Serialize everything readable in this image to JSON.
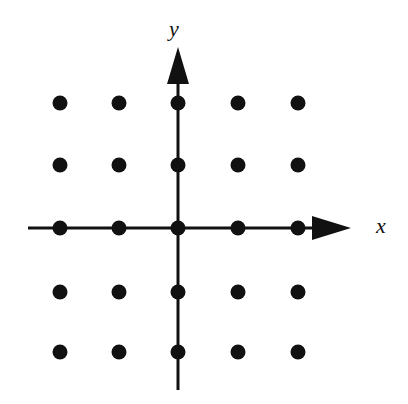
{
  "figure": {
    "background_color": "#ffffff",
    "ink_color": "#111111",
    "width": 408,
    "height": 404
  },
  "axes": {
    "origin": {
      "x": 178,
      "y": 228
    },
    "x_axis": {
      "name": "x-axis",
      "label": "x",
      "label_position": {
        "x": 381,
        "y": 228
      },
      "label_font_size": 22,
      "line": {
        "x1": 28,
        "y1": 228,
        "x2": 316,
        "y2": 228
      },
      "stroke_width": 3,
      "arrow": {
        "base_x": 312,
        "tip_x": 351,
        "half_height": 12,
        "direction": "right"
      }
    },
    "y_axis": {
      "name": "y-axis",
      "label": "y",
      "label_position": {
        "x": 174,
        "y": 31
      },
      "label_font_size": 22,
      "line": {
        "x1": 178,
        "y1": 390,
        "x2": 178,
        "y2": 80
      },
      "stroke_width": 3,
      "arrow": {
        "base_y": 84,
        "tip_y": 47,
        "half_width": 11,
        "direction": "up"
      }
    }
  },
  "chart_data": {
    "type": "scatter",
    "xlabel": "x",
    "ylabel": "y",
    "grid": false,
    "legend": false,
    "xlim": [
      -2,
      2
    ],
    "ylim": [
      -2,
      2
    ],
    "xticklabels": [],
    "yticklabels": [],
    "marker": {
      "shape": "circle",
      "color": "#111111",
      "diameter_px": 15
    },
    "point_count": 25,
    "columns_px": [
      60,
      119,
      178,
      238,
      298
    ],
    "rows_px": [
      103,
      165,
      228,
      292,
      352
    ],
    "x": [
      -2,
      -1,
      0,
      1,
      2,
      -2,
      -1,
      0,
      1,
      2,
      -2,
      -1,
      0,
      1,
      2,
      -2,
      -1,
      0,
      1,
      2,
      -2,
      -1,
      0,
      1,
      2
    ],
    "y": [
      2,
      2,
      2,
      2,
      2,
      1,
      1,
      1,
      1,
      1,
      0,
      0,
      0,
      0,
      0,
      -1,
      -1,
      -1,
      -1,
      -1,
      -2,
      -2,
      -2,
      -2,
      -2
    ],
    "points": [
      {
        "x": -2,
        "y": 2,
        "px": 60,
        "py": 103
      },
      {
        "x": -1,
        "y": 2,
        "px": 119,
        "py": 103
      },
      {
        "x": 0,
        "y": 2,
        "px": 178,
        "py": 103
      },
      {
        "x": 1,
        "y": 2,
        "px": 238,
        "py": 103
      },
      {
        "x": 2,
        "y": 2,
        "px": 298,
        "py": 103
      },
      {
        "x": -2,
        "y": 1,
        "px": 60,
        "py": 165
      },
      {
        "x": -1,
        "y": 1,
        "px": 119,
        "py": 165
      },
      {
        "x": 0,
        "y": 1,
        "px": 178,
        "py": 165
      },
      {
        "x": 1,
        "y": 1,
        "px": 238,
        "py": 165
      },
      {
        "x": 2,
        "y": 1,
        "px": 298,
        "py": 165
      },
      {
        "x": -2,
        "y": 0,
        "px": 60,
        "py": 228
      },
      {
        "x": -1,
        "y": 0,
        "px": 119,
        "py": 228
      },
      {
        "x": 0,
        "y": 0,
        "px": 178,
        "py": 228
      },
      {
        "x": 1,
        "y": 0,
        "px": 238,
        "py": 228
      },
      {
        "x": 2,
        "y": 0,
        "px": 298,
        "py": 228
      },
      {
        "x": -2,
        "y": -1,
        "px": 60,
        "py": 292
      },
      {
        "x": -1,
        "y": -1,
        "px": 119,
        "py": 292
      },
      {
        "x": 0,
        "y": -1,
        "px": 178,
        "py": 292
      },
      {
        "x": 1,
        "y": -1,
        "px": 238,
        "py": 292
      },
      {
        "x": 2,
        "y": -1,
        "px": 298,
        "py": 292
      },
      {
        "x": -2,
        "y": -2,
        "px": 60,
        "py": 352
      },
      {
        "x": -1,
        "y": -2,
        "px": 119,
        "py": 352
      },
      {
        "x": 0,
        "y": -2,
        "px": 178,
        "py": 352
      },
      {
        "x": 1,
        "y": -2,
        "px": 238,
        "py": 352
      },
      {
        "x": 2,
        "y": -2,
        "px": 298,
        "py": 352
      }
    ]
  }
}
